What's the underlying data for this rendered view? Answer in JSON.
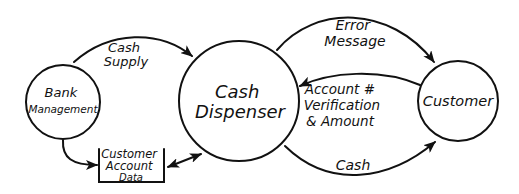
{
  "diagram": {
    "type": "data-flow-diagram",
    "style": "hand-drawn",
    "colors": {
      "ink": "#111111",
      "background": "#ffffff"
    },
    "nodes": [
      {
        "id": "bank",
        "shape": "circle",
        "label_lines": [
          "Bank",
          "Management"
        ]
      },
      {
        "id": "dispenser",
        "shape": "circle",
        "label_lines": [
          "Cash",
          "Dispenser"
        ]
      },
      {
        "id": "customer",
        "shape": "circle",
        "label_lines": [
          "Customer"
        ]
      },
      {
        "id": "store",
        "shape": "data-store",
        "label_lines": [
          "Customer",
          "Account",
          "Data"
        ]
      }
    ],
    "flows": [
      {
        "from": "bank",
        "to": "dispenser",
        "label_lines": [
          "Cash",
          "Supply"
        ]
      },
      {
        "from": "bank",
        "to": "store",
        "label_lines": []
      },
      {
        "from": "store",
        "to": "dispenser",
        "bidirectional": true,
        "label_lines": []
      },
      {
        "from": "dispenser",
        "to": "customer",
        "label_lines": [
          "Error",
          "Message"
        ]
      },
      {
        "from": "customer",
        "to": "dispenser",
        "label_lines": [
          "Account #",
          "Verification",
          "& Amount"
        ]
      },
      {
        "from": "dispenser",
        "to": "customer",
        "label_lines": [
          "Cash"
        ]
      }
    ]
  }
}
